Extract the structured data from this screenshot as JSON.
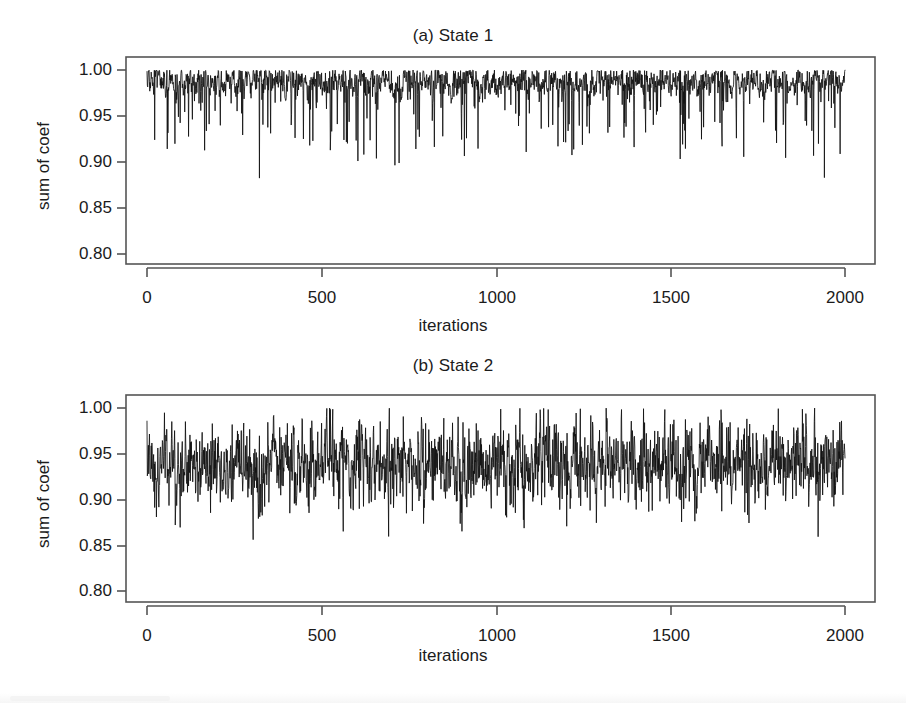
{
  "figure": {
    "background_color": "#ffffff",
    "line_color": "#111111",
    "axis_color": "#555555",
    "panels": [
      {
        "id": "a",
        "title": "(a) State 1",
        "xlabel": "iterations",
        "ylabel": "sum of coef",
        "ytick_labels": [
          "1.00",
          "0.95",
          "0.90",
          "0.85",
          "0.80"
        ],
        "xtick_labels": [
          "0",
          "500",
          "1000",
          "1500",
          "2000"
        ]
      },
      {
        "id": "b",
        "title": "(b) State 2",
        "xlabel": "iterations",
        "ylabel": "sum of coef",
        "ytick_labels": [
          "1.00",
          "0.95",
          "0.90",
          "0.85",
          "0.80"
        ],
        "xtick_labels": [
          "0",
          "500",
          "1000",
          "1500",
          "2000"
        ]
      }
    ]
  },
  "chart_data": [
    {
      "type": "line",
      "title": "(a) State 1",
      "xlabel": "iterations",
      "ylabel": "sum of coef",
      "xlim": [
        0,
        2000
      ],
      "ylim": [
        0.8,
        1.0
      ],
      "xticks": [
        0,
        500,
        1000,
        1500,
        2000
      ],
      "yticks": [
        0.8,
        0.85,
        0.9,
        0.95,
        1.0
      ],
      "grid": false,
      "legend": "none",
      "n_points": 2000,
      "series_name": "State 1 sum of coef",
      "description": "MCMC trace, dense sawtooth concentrated near upper bound with frequent downward spikes",
      "stats": {
        "mode": 0.983,
        "upper_envelope": 0.999,
        "typical_low": 0.955,
        "spike_low": 0.905,
        "min_observed": 0.884,
        "max_observed": 1.0,
        "mean": 0.973,
        "skew": "left"
      },
      "annotations": []
    },
    {
      "type": "line",
      "title": "(b) State 2",
      "xlabel": "iterations",
      "ylabel": "sum of coef",
      "xlim": [
        0,
        2000
      ],
      "ylim": [
        0.8,
        1.0
      ],
      "xticks": [
        0,
        500,
        1000,
        1500,
        2000
      ],
      "yticks": [
        0.8,
        0.85,
        0.9,
        0.95,
        1.0
      ],
      "grid": false,
      "legend": "none",
      "n_points": 2000,
      "series_name": "State 2 sum of coef",
      "description": "MCMC trace, dense oscillation centered near 0.94, roughly symmetric band",
      "stats": {
        "mode": 0.938,
        "upper_envelope": 0.999,
        "typical_low": 0.9,
        "spike_low": 0.87,
        "min_observed": 0.856,
        "max_observed": 1.0,
        "mean": 0.938,
        "skew": "symmetric"
      },
      "annotations": []
    }
  ],
  "geometry": {
    "panel_a": {
      "box": {
        "x": 126,
        "y": 57,
        "w": 749,
        "h": 207
      },
      "x_axis_y": 278,
      "x_axis_x0": 147,
      "x_axis_x1": 845,
      "y_tick_x": 126,
      "y_tick_pixels": [
        70,
        116,
        162,
        208,
        254
      ],
      "x_tick_pixels": [
        147,
        322,
        497,
        671,
        845
      ]
    },
    "panel_b": {
      "box": {
        "x": 126,
        "y": 395,
        "w": 749,
        "h": 207
      },
      "x_axis_y": 616,
      "x_axis_x0": 147,
      "x_axis_x1": 845,
      "y_tick_x": 126,
      "y_tick_pixels": [
        408,
        454,
        500,
        546,
        591
      ],
      "x_tick_pixels": [
        147,
        322,
        497,
        671,
        845
      ]
    }
  }
}
